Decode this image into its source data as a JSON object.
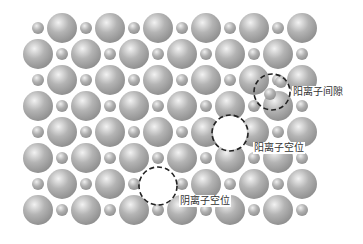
{
  "diagram": {
    "title": "",
    "colors": {
      "background": "#ffffff",
      "large_ion_light": "#f2f2f2",
      "large_ion_mid": "#b4b4b4",
      "large_ion_dark": "#8a8a8a",
      "small_ion_light": "#efefef",
      "small_ion_dark": "#8c8c8c",
      "dashed_circle": "#222222",
      "label_text": "#333333"
    },
    "lattice": {
      "rows_y": [
        28,
        54,
        80,
        106,
        132,
        158,
        184,
        210
      ],
      "col_step": 24,
      "x_start": 38,
      "columns": 12,
      "large_radius": 15,
      "small_radius": 6,
      "pattern": "alternating large/small; even rows start small, odd rows start large"
    },
    "removed_ions": [
      {
        "row": 4,
        "col": 8,
        "type": "large"
      },
      {
        "row": 6,
        "col": 5,
        "type": "large"
      }
    ],
    "extra_ions": [
      {
        "x": 270,
        "y": 94,
        "type": "small"
      },
      {
        "x": 281,
        "y": 82,
        "type": "small"
      }
    ],
    "defects": [
      {
        "name": "cation-interstitial",
        "cx": 272,
        "cy": 92,
        "r": 18,
        "label": "阳离子间隙"
      },
      {
        "name": "cation-vacancy",
        "cx": 230,
        "cy": 133,
        "r": 18,
        "label": "阳离子空位"
      },
      {
        "name": "anion-vacancy",
        "cx": 158,
        "cy": 186,
        "r": 19,
        "label": "阴离子空位"
      }
    ]
  }
}
